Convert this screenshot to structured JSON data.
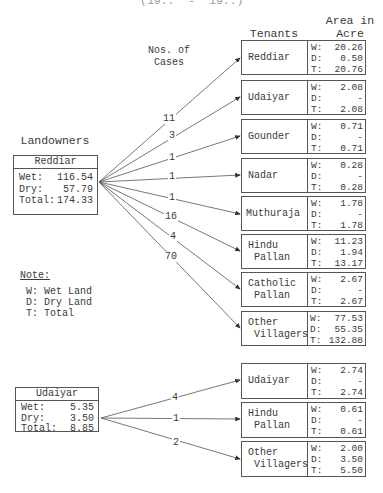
{
  "header": {
    "partial_top_line": "(19..  -  19..)",
    "tenants_label": "Tenants",
    "area_label_line1": "Area in",
    "area_label_line2": "Acre",
    "cases_label_line1": "Nos. of",
    "cases_label_line2": "Cases",
    "landowners_label": "Landowners"
  },
  "note": {
    "title": "Note:",
    "items": [
      "W: Wet Land",
      "D: Dry Land",
      "T: Total"
    ]
  },
  "colors": {
    "line": "#555555",
    "text": "#3a3a3a",
    "background": "#ffffff"
  },
  "landowners": [
    {
      "name": "Reddiar",
      "wet_label": "Wet:",
      "wet": "116.54",
      "dry_label": "Dry:",
      "dry": "57.79",
      "total_label": "Total:",
      "total": "174.33",
      "tenants": [
        {
          "name": "Reddiar",
          "cases": "11",
          "W": "20.26",
          "D": "0.50",
          "T": "20.76"
        },
        {
          "name": "Udaiyar",
          "cases": "3",
          "W": "2.08",
          "D": "-",
          "T": "2.08"
        },
        {
          "name": "Gounder",
          "cases": "1",
          "W": "0.71",
          "D": "-",
          "T": "0.71"
        },
        {
          "name": "Nadar",
          "cases": "1",
          "W": "0.28",
          "D": "-",
          "T": "0.28"
        },
        {
          "name": "Muthuraja",
          "cases": "1",
          "W": "1.78",
          "D": "-",
          "T": "1.78"
        },
        {
          "name": "Hindu\n Pallan",
          "cases": "16",
          "W": "11.23",
          "D": "1.94",
          "T": "13.17"
        },
        {
          "name": "Catholic\n Pallan",
          "cases": "4",
          "W": "2.67",
          "D": "-",
          "T": "2.67"
        },
        {
          "name": "Other\n Villagers",
          "cases": "70",
          "W": "77.53",
          "D": "55.35",
          "T": "132.88"
        }
      ]
    },
    {
      "name": "Udaiyar",
      "wet_label": "Wet:",
      "wet": "5.35",
      "dry_label": "Dry:",
      "dry": "3.50",
      "total_label": "Total:",
      "total": "8.85",
      "tenants": [
        {
          "name": "Udaiyar",
          "cases": "4",
          "W": "2.74",
          "D": "-",
          "T": "2.74"
        },
        {
          "name": "Hindu\n Pallan",
          "cases": "1",
          "W": "0.61",
          "D": "-",
          "T": "0.61"
        },
        {
          "name": "Other\n Villagers",
          "cases": "2",
          "W": "2.00",
          "D": "3.50",
          "T": "5.50"
        }
      ]
    }
  ],
  "value_prefixes": {
    "W": "W:",
    "D": "D:",
    "T": "T:"
  }
}
